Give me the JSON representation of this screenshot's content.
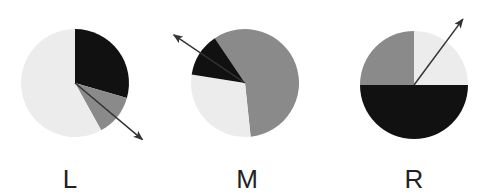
{
  "colors": {
    "light": "#ececec",
    "gray": "#8a8a8a",
    "black": "#111111",
    "arrow": "#333333",
    "label": "#222222"
  },
  "pies": [
    {
      "label": "L",
      "cx": 75,
      "cy": 83,
      "r": 54,
      "segments": [
        {
          "name": "black",
          "color": "black",
          "start": 0,
          "end": 106,
          "percent": 29.4
        },
        {
          "name": "gray",
          "color": "gray",
          "start": 106,
          "end": 151,
          "percent": 12.6
        },
        {
          "name": "light",
          "color": "light",
          "start": 151,
          "end": 360,
          "percent": 58.0
        }
      ],
      "arrow": {
        "angle": 130,
        "length": 88
      }
    },
    {
      "label": "M",
      "cx": 245,
      "cy": 83,
      "r": 54,
      "segments": [
        {
          "name": "gray",
          "color": "gray",
          "start": 326,
          "end": 534,
          "percent": 57.6
        },
        {
          "name": "light",
          "color": "light",
          "start": 174,
          "end": 279,
          "percent": 29.1
        },
        {
          "name": "black",
          "color": "black",
          "start": 279,
          "end": 326,
          "percent": 13.3
        }
      ],
      "arrow": {
        "angle": 304,
        "length": 86
      }
    },
    {
      "label": "R",
      "cx": 414,
      "cy": 85,
      "r": 54,
      "segments": [
        {
          "name": "light",
          "color": "light",
          "start": 0,
          "end": 90,
          "percent": 25.0
        },
        {
          "name": "black",
          "color": "black",
          "start": 90,
          "end": 270,
          "percent": 50.0
        },
        {
          "name": "gray",
          "color": "gray",
          "start": 270,
          "end": 360,
          "percent": 25.0
        }
      ],
      "arrow": {
        "angle": 36.6,
        "length": 82
      }
    }
  ],
  "labels": {
    "left": "L",
    "middle": "M",
    "right": "R"
  }
}
